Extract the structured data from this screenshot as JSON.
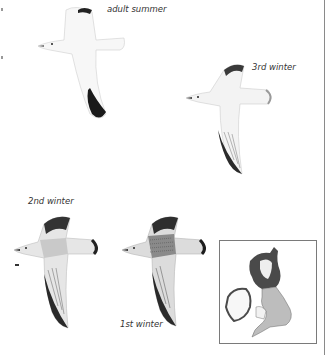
{
  "plates": [
    {
      "id": "adult-summer",
      "label": "adult summer"
    },
    {
      "id": "3rd-winter",
      "label": "3rd winter"
    },
    {
      "id": "2nd-winter",
      "label": "2nd winter"
    },
    {
      "id": "1st-winter",
      "label": "1st winter"
    }
  ],
  "map": {
    "title": "distribution map",
    "colors": {
      "dark": "#4a4a4a",
      "light": "#bdbdbd",
      "ireland": "#ffffff",
      "outline": "#555555"
    }
  }
}
